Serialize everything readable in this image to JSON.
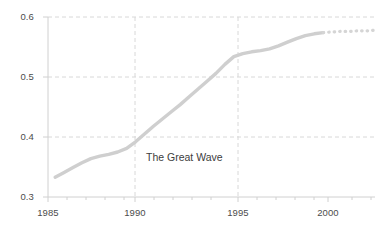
{
  "chart_data": {
    "type": "line",
    "title": "",
    "xlabel": "",
    "ylabel": "",
    "xlim": [
      1984.6,
      2002.9
    ],
    "ylim": [
      0.3,
      0.6
    ],
    "grid": true,
    "legend": null,
    "line_color": "#cfcfcf",
    "grid_color": "#d8d8d8",
    "axis_color": "#d0d0d0",
    "text_color": "#4c4c4c",
    "x_ticks": [
      1985,
      1990,
      1995,
      2000
    ],
    "x_tick_labels": [
      "1985",
      "1990",
      "1995",
      "2000"
    ],
    "y_ticks": [
      0.3,
      0.4,
      0.5,
      0.6
    ],
    "y_tick_labels": [
      "0.3",
      "0.4",
      "0.5",
      "0.6"
    ],
    "series": [
      {
        "name": "observed",
        "style": "solid",
        "x": [
          1985.0,
          1985.5,
          1986.0,
          1986.5,
          1987.0,
          1987.5,
          1988.0,
          1988.5,
          1989.0,
          1989.5,
          1990.0,
          1990.5,
          1991.0,
          1991.5,
          1992.0,
          1992.5,
          1993.0,
          1993.5,
          1994.0,
          1994.5,
          1995.0,
          1995.5,
          1996.0,
          1996.5,
          1997.0,
          1997.5,
          1998.0,
          1998.5,
          1999.0,
          1999.5,
          2000.0
        ],
        "y": [
          0.333,
          0.341,
          0.349,
          0.357,
          0.364,
          0.368,
          0.371,
          0.375,
          0.381,
          0.392,
          0.405,
          0.418,
          0.43,
          0.442,
          0.454,
          0.467,
          0.48,
          0.493,
          0.506,
          0.521,
          0.534,
          0.539,
          0.542,
          0.544,
          0.547,
          0.552,
          0.558,
          0.564,
          0.569,
          0.572,
          0.574
        ]
      },
      {
        "name": "projected",
        "style": "dotted",
        "x": [
          2000.0,
          2000.5,
          2001.0,
          2001.5,
          2002.0,
          2002.5,
          2002.9
        ],
        "y": [
          0.574,
          0.575,
          0.576,
          0.576,
          0.577,
          0.577,
          0.578
        ]
      }
    ],
    "annotations": [
      {
        "text": "The Great Wave",
        "x": 1991.0,
        "y": 0.372
      }
    ]
  }
}
